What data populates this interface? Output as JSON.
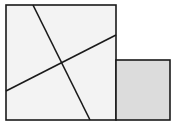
{
  "diagram": {
    "type": "geometric-dissection",
    "background": "#ffffff",
    "stroke_color": "#1a1a1a",
    "large_square": {
      "x": 6,
      "y": 5,
      "width": 110,
      "height": 115,
      "fill": "#f3f3f3"
    },
    "small_square": {
      "x": 116,
      "y": 60,
      "width": 54,
      "height": 60,
      "fill": "#dcdcdc"
    },
    "cut_lines": [
      {
        "x1": 33,
        "y1": 5,
        "x2": 90,
        "y2": 120
      },
      {
        "x1": 6,
        "y1": 91,
        "x2": 116,
        "y2": 35
      }
    ],
    "intersection": {
      "x": 62,
      "y": 63
    }
  }
}
